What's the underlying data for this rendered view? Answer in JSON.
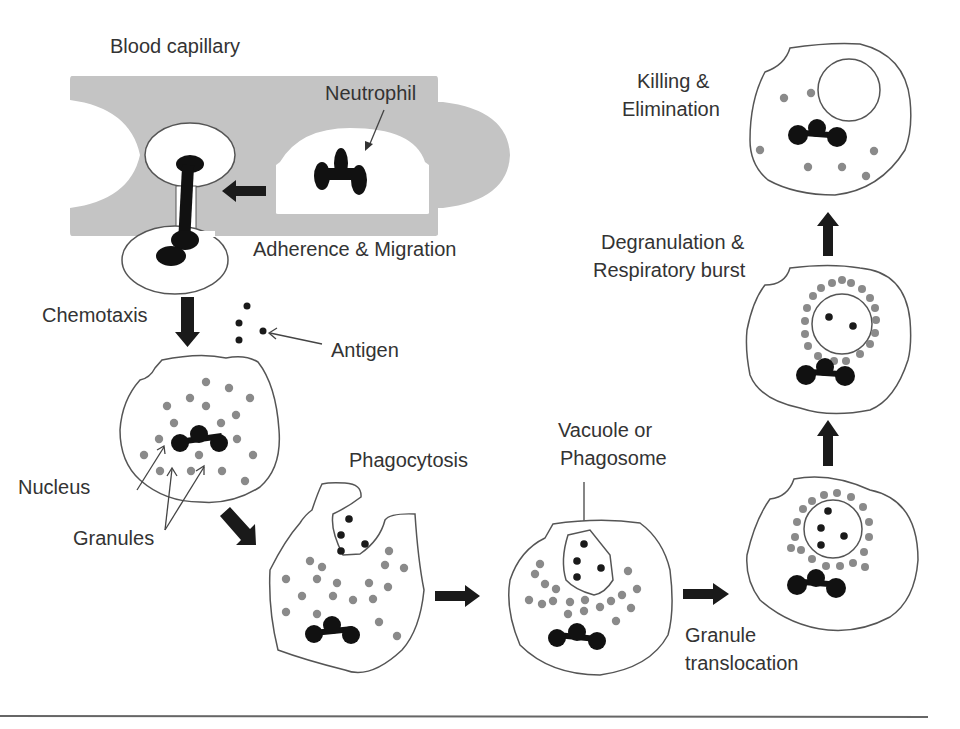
{
  "colors": {
    "capillary": "#c4c4c4",
    "granule": "#8a8a8a",
    "nucleus": "#111111",
    "antigen": "#1a1a1a",
    "outline": "#555555",
    "text": "#333333"
  },
  "labels": {
    "blood_capillary": "Blood capillary",
    "neutrophil": "Neutrophil",
    "adherence_migration": "Adherence & Migration",
    "chemotaxis": "Chemotaxis",
    "antigen": "Antigen",
    "nucleus": "Nucleus",
    "granules": "Granules",
    "phagocytosis": "Phagocytosis",
    "vacuole_line1": "Vacuole or",
    "vacuole_line2": "Phagosome",
    "granule_translocation_line1": "Granule",
    "granule_translocation_line2": "translocation",
    "degranulation_line1": "Degranulation &",
    "degranulation_line2": "Respiratory burst",
    "killing_line1": "Killing &",
    "killing_line2": "Elimination"
  },
  "stages": [
    {
      "id": 1,
      "name": "Adherence & Migration"
    },
    {
      "id": 2,
      "name": "Chemotaxis"
    },
    {
      "id": 3,
      "name": "Phagocytosis"
    },
    {
      "id": 4,
      "name": "Vacuole or Phagosome"
    },
    {
      "id": 5,
      "name": "Granule translocation"
    },
    {
      "id": 6,
      "name": "Degranulation & Respiratory burst"
    },
    {
      "id": 7,
      "name": "Killing & Elimination"
    }
  ]
}
